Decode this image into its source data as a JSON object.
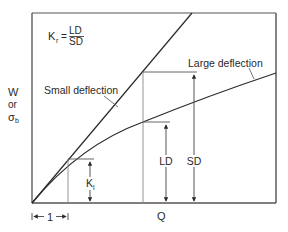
{
  "diagram": {
    "formula": {
      "lhs": "K",
      "lhs_sub": "r",
      "equals": "=",
      "numerator": "LD",
      "denominator": "SD"
    },
    "y_axis_label": {
      "line1": "W",
      "line2": "or",
      "line3": "σ",
      "line3_sub": "b"
    },
    "x_axis_label": "Q",
    "curves": {
      "small": "Small deflection",
      "large": "Large deflection"
    },
    "dimensions": {
      "ld": "LD",
      "sd": "SD",
      "kl": "K",
      "kl_sub": "l",
      "unit": "1"
    },
    "colors": {
      "line": "#2a2a2a",
      "frame": "#555555",
      "guide": "#888888",
      "background": "#ffffff"
    }
  }
}
